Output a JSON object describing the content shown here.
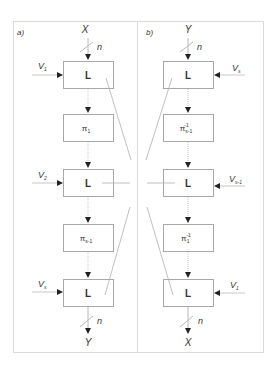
{
  "diagram": {
    "panels": [
      {
        "id": "a",
        "tag": "a)",
        "input": "X",
        "output": "Y",
        "bus_width": "n",
        "blocks": [
          {
            "type": "L",
            "label": "L",
            "key": "V",
            "key_sub": "1"
          },
          {
            "type": "perm",
            "label": "π",
            "sub": "1",
            "sup": ""
          },
          {
            "type": "L",
            "label": "L",
            "key": "V",
            "key_sub": "2"
          },
          {
            "type": "perm",
            "label": "π",
            "sub": "s-1",
            "sup": ""
          },
          {
            "type": "L",
            "label": "L",
            "key": "V",
            "key_sub": "s"
          }
        ]
      },
      {
        "id": "b",
        "tag": "b)",
        "input": "Y",
        "output": "X",
        "bus_width": "n",
        "blocks": [
          {
            "type": "L",
            "label": "L",
            "key": "V",
            "key_sub": "s"
          },
          {
            "type": "perm",
            "label": "π",
            "sub": "s-1",
            "sup": "-1"
          },
          {
            "type": "L",
            "label": "L",
            "key": "V",
            "key_sub": "s-1"
          },
          {
            "type": "perm",
            "label": "π",
            "sub": "1",
            "sup": "-1"
          },
          {
            "type": "L",
            "label": "L",
            "key": "V",
            "key_sub": "1"
          }
        ]
      }
    ],
    "colors": {
      "line": "#b8b8b8",
      "box": "#a8a8a8",
      "frame": "#d8d8d8",
      "text": "#333333",
      "arrow": "#222222"
    }
  }
}
